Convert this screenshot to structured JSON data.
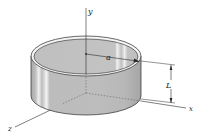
{
  "diagram": {
    "labels": {
      "y_axis": "y",
      "x_axis": "x",
      "z_axis": "z",
      "radius": "a",
      "height": "L"
    },
    "colors": {
      "shell_fill": "#b9b9b9",
      "inner_fill": "#c4c4c4",
      "highlight": "#f2f2f2",
      "line": "#2a2a2a",
      "background": "#ffffff"
    }
  }
}
